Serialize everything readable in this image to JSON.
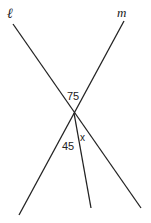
{
  "diagram": {
    "type": "intersecting-lines-angle-diagram",
    "lines": [
      {
        "name": "ℓ",
        "from": [
          13,
          24
        ],
        "to": [
          141,
          208
        ]
      },
      {
        "name": "m",
        "from": [
          124,
          21
        ],
        "to": [
          19,
          215
        ]
      }
    ],
    "ray": {
      "from": [
        74,
        113
      ],
      "to": [
        91,
        208
      ]
    },
    "intersection": [
      74,
      113
    ],
    "angle_labels": [
      {
        "text": "75",
        "x": 68,
        "y": 100
      },
      {
        "text": "45",
        "x": 63,
        "y": 150
      },
      {
        "text": "x",
        "x": 81,
        "y": 141
      }
    ],
    "line_labels": [
      {
        "text": "ℓ",
        "x": 7,
        "y": 18
      },
      {
        "text": "m",
        "x": 119,
        "y": 17
      }
    ],
    "stroke_color": "#222222"
  }
}
